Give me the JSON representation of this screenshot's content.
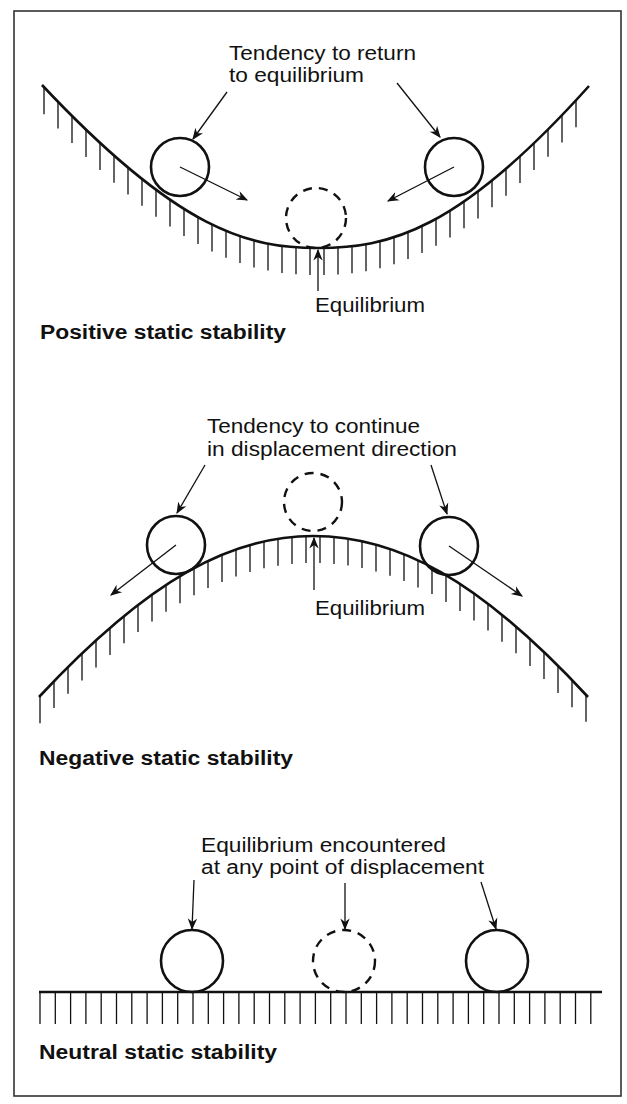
{
  "figure": {
    "frame": {
      "x": 14,
      "y": 11,
      "width": 607,
      "height": 1085,
      "stroke": "#333333"
    },
    "ink_color": "#111111"
  },
  "panels": [
    {
      "id": "positive",
      "title": "Positive static stability",
      "note_lines": [
        "Tendency to return",
        "to equilibrium"
      ],
      "equilibrium_label": "Equilibrium",
      "surface": "valley",
      "curve_path": "M42,85 C180,232 250,248 318,248 C388,248 458,232 589,86",
      "hatch": {
        "from_x": 44,
        "to_x": 588,
        "step": 14,
        "length": 27
      },
      "balls": [
        {
          "role": "displaced-left",
          "cx": 180,
          "cy": 167,
          "r": 29,
          "dashed": false
        },
        {
          "role": "displaced-right",
          "cx": 454,
          "cy": 167,
          "r": 29,
          "dashed": false
        },
        {
          "role": "equilibrium",
          "cx": 316,
          "cy": 218,
          "r": 30,
          "dashed": true
        }
      ]
    },
    {
      "id": "negative",
      "title": "Negative static stability",
      "note_lines": [
        "Tendency to continue",
        "in displacement direction"
      ],
      "equilibrium_label": "Equilibrium",
      "surface": "hill",
      "curve_path": "M39,697 C150,578 232,536 313,536 C396,536 478,578 588,697",
      "hatch": {
        "from_x": 40,
        "to_x": 587,
        "step": 14,
        "length": 27
      },
      "balls": [
        {
          "role": "displaced-left",
          "cx": 176,
          "cy": 545,
          "r": 29,
          "dashed": false
        },
        {
          "role": "displaced-right",
          "cx": 449,
          "cy": 546,
          "r": 29,
          "dashed": false
        },
        {
          "role": "equilibrium",
          "cx": 313,
          "cy": 502,
          "r": 29,
          "dashed": true
        }
      ]
    },
    {
      "id": "neutral",
      "title": "Neutral static stability",
      "note_lines": [
        "Equilibrium encountered",
        "at any point of displacement"
      ],
      "surface": "flat",
      "curve_path": "M39,992 L602,992",
      "hatch": {
        "from_x": 40,
        "to_x": 601,
        "step": 15.3,
        "length": 32
      },
      "balls": [
        {
          "role": "position-left",
          "cx": 192,
          "cy": 961,
          "r": 31,
          "dashed": false
        },
        {
          "role": "position-middle",
          "cx": 344,
          "cy": 961,
          "r": 31,
          "dashed": true
        },
        {
          "role": "position-right",
          "cx": 497,
          "cy": 961,
          "r": 31,
          "dashed": false
        }
      ]
    }
  ]
}
